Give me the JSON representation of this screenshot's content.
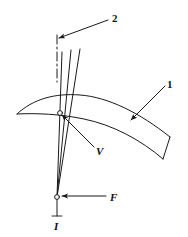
{
  "figure": {
    "background_color": "#ffffff",
    "line_color": "#1a1a1a",
    "width": 188,
    "height": 237,
    "labels": [
      {
        "key": "part_two",
        "text": "2",
        "style": "bold",
        "x": 112,
        "y": 13,
        "refers_to": "centerline-axis"
      },
      {
        "key": "part_one",
        "text": "1",
        "style": "bold",
        "x": 167,
        "y": 79,
        "refers_to": "curved-band"
      },
      {
        "key": "velocity",
        "text": "V",
        "style": "bold-italic",
        "x": 96,
        "y": 146,
        "refers_to": "band-intersection-node"
      },
      {
        "key": "force",
        "text": "F",
        "style": "bold-italic",
        "x": 110,
        "y": 192,
        "refers_to": "apex-node"
      },
      {
        "key": "current",
        "text": "I",
        "style": "bold-italic",
        "x": 54,
        "y": 221,
        "refers_to": "apex-node"
      }
    ],
    "leaders": [
      {
        "key": "leader-2",
        "from": [
          108,
          20
        ],
        "to": [
          59,
          38
        ],
        "arrow": "to"
      },
      {
        "key": "leader-1",
        "from": [
          165,
          86
        ],
        "to": [
          131,
          120
        ],
        "arrow": "to"
      },
      {
        "key": "leader-V",
        "from": [
          94,
          147
        ],
        "to": [
          62,
          115
        ],
        "arrow": "to"
      },
      {
        "key": "leader-F",
        "from": [
          106,
          196
        ],
        "to": [
          62,
          196
        ],
        "arrow": "to"
      }
    ],
    "geometry": {
      "apex": [
        57,
        197
      ],
      "centerline": {
        "x": 57,
        "y_top": 35,
        "y_bottom": 82,
        "dash_pattern": "9,3,2,3"
      },
      "rays": [
        {
          "key": "ray-left",
          "top": [
            62,
            52
          ],
          "bottom": [
            57,
            197
          ]
        },
        {
          "key": "ray-middle",
          "top": [
            71,
            50
          ],
          "bottom": [
            57,
            197
          ]
        },
        {
          "key": "ray-right",
          "top": [
            80,
            49
          ],
          "bottom": [
            57,
            197
          ]
        }
      ],
      "band": {
        "key": "curved-band",
        "left_tip": [
          17,
          114
        ],
        "right_end_top": [
          170,
          137
        ],
        "right_end_bottom": [
          163,
          159
        ],
        "note": "tapered crescent band sweeping right and downward"
      },
      "nodes": [
        {
          "key": "band-intersection-node",
          "x": 60,
          "y": 113,
          "radius": 2.4
        },
        {
          "key": "apex-node",
          "x": 57,
          "y": 197,
          "radius": 2.4
        }
      ]
    }
  }
}
